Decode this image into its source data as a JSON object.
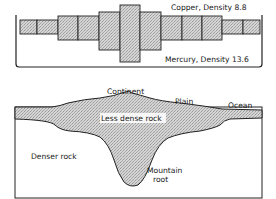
{
  "top_diagram": {
    "copper_label": "Copper, Density 8.8",
    "mercury_label": "Mercury, Density 13.6",
    "blocks": [
      {
        "x": 20,
        "y": 20,
        "w": 17,
        "h": 14
      },
      {
        "x": 37,
        "y": 20,
        "w": 21,
        "h": 14
      },
      {
        "x": 58,
        "y": 16,
        "w": 20,
        "h": 24
      },
      {
        "x": 78,
        "y": 16,
        "w": 21,
        "h": 24
      },
      {
        "x": 99,
        "y": 12,
        "w": 21,
        "h": 38
      },
      {
        "x": 120,
        "y": 5,
        "w": 20,
        "h": 57
      },
      {
        "x": 140,
        "y": 12,
        "w": 21,
        "h": 38
      },
      {
        "x": 161,
        "y": 16,
        "w": 21,
        "h": 24
      },
      {
        "x": 182,
        "y": 16,
        "w": 20,
        "h": 24
      },
      {
        "x": 202,
        "y": 16,
        "w": 20,
        "h": 24
      },
      {
        "x": 222,
        "y": 20,
        "w": 21,
        "h": 14
      },
      {
        "x": 243,
        "y": 20,
        "w": 17,
        "h": 14
      }
    ]
  },
  "bottom_diagram": {
    "continent_label": "Continent",
    "plain_label": "Plain",
    "ocean_label": "Ocean",
    "less_dense_label": "Less dense rock",
    "denser_label": "Denser rock",
    "mountain_label_line1": "Mountain",
    "mountain_label_line2": "root"
  }
}
